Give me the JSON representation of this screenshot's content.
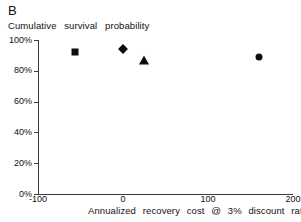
{
  "figure": {
    "panel_letter": "B"
  },
  "chart_data": {
    "type": "scatter",
    "title": "",
    "panel_label": "B",
    "xlabel": "Annualized  recovery  cost  @  3%  discount  rate",
    "ylabel": "Cumulative  survival  probability",
    "xlim": [
      -100,
      200
    ],
    "ylim": [
      0,
      100
    ],
    "xticks": [
      -100,
      0,
      100,
      200
    ],
    "xtick_labels": [
      "-100",
      "0",
      "100",
      "200"
    ],
    "yticks": [
      0,
      20,
      40,
      60,
      80,
      100
    ],
    "ytick_labels": [
      "0%",
      "20%",
      "40%",
      "60%",
      "80%",
      "100%"
    ],
    "grid": false,
    "legend": "none",
    "points": [
      {
        "label": "square-point",
        "marker": "square",
        "x": -57,
        "y": 92
      },
      {
        "label": "diamond-point",
        "marker": "diamond",
        "x": 0,
        "y": 94
      },
      {
        "label": "triangle-point",
        "marker": "triangle",
        "x": 25,
        "y": 87
      },
      {
        "label": "circle-point",
        "marker": "circle",
        "x": 160,
        "y": 89
      }
    ]
  },
  "colors": {
    "marker": "#0d0d0d",
    "axis": "#3a3a3a",
    "text": "#111111",
    "background": "#ffffff"
  }
}
